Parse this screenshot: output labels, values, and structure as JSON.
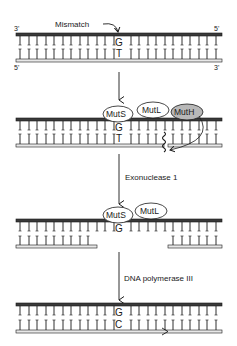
{
  "diagram": {
    "colors": {
      "ink": "#1a1a1a",
      "strand_top_fill": "#3a3a3a",
      "strand_bottom_fill": "#e8e8e8",
      "muth_fill": "#b8b8b8",
      "background": "#ffffff"
    },
    "panel1": {
      "mismatch_label": "Mismatch",
      "top_left_end": "3'",
      "top_right_end": "5'",
      "bottom_left_end": "5'",
      "bottom_right_end": "3'",
      "top_base": "G",
      "bottom_base": "T"
    },
    "panel2": {
      "proteins": [
        "MutS",
        "MutL",
        "MutH"
      ],
      "top_base": "G",
      "bottom_base": "T"
    },
    "step2_label": "Exonuclease 1",
    "panel3": {
      "proteins": [
        "MutS",
        "MutL"
      ],
      "top_base": "G"
    },
    "step3_label": "DNA polymerase III",
    "panel4": {
      "top_base": "G",
      "bottom_base": "C"
    }
  }
}
